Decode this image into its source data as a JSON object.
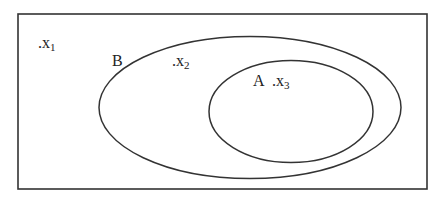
{
  "diagram": {
    "type": "venn",
    "universe": {
      "label": ""
    },
    "sets": [
      {
        "name": "B",
        "label": "B",
        "contains": [
          "A"
        ]
      },
      {
        "name": "A",
        "label": "A",
        "subset_of": "B"
      }
    ],
    "elements": [
      {
        "label": ".x",
        "sub": "1",
        "region": "outside B"
      },
      {
        "label": ".x",
        "sub": "2",
        "region": "B only"
      },
      {
        "label": ".x",
        "sub": "3",
        "region": "A"
      }
    ],
    "colors": {
      "stroke": "#333333",
      "text": "#222222",
      "background": "#ffffff"
    }
  }
}
